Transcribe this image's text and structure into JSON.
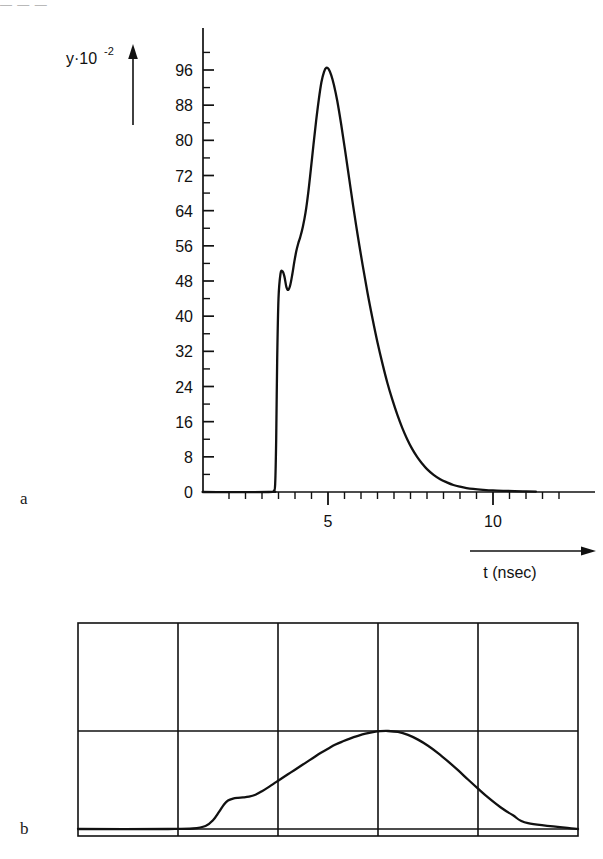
{
  "figure": {
    "top_artifact_text": "— — —",
    "panels": [
      {
        "letter": "a"
      },
      {
        "letter": "b"
      }
    ]
  },
  "panel_a": {
    "y_axis_title_main": "y·10",
    "y_axis_title_exponent": "-2",
    "x_axis_title": "t (nsec)",
    "y_tick_labels": [
      "0",
      "8",
      "16",
      "24",
      "32",
      "40",
      "48",
      "56",
      "64",
      "72",
      "80",
      "88",
      "96"
    ],
    "x_tick_labels": [
      "5",
      "10"
    ]
  },
  "chart_data": [
    {
      "type": "line",
      "name": "panel-a-pulse",
      "title": "",
      "xlabel": "t (nsec)",
      "ylabel": "y·10^-2",
      "xlim": [
        1.2,
        11.4
      ],
      "ylim": [
        0,
        101
      ],
      "grid": false,
      "legend": false,
      "y_ticks_major": [
        0,
        8,
        16,
        24,
        32,
        40,
        48,
        56,
        64,
        72,
        80,
        88,
        96
      ],
      "y_ticks_minor_step": 4,
      "x_ticks_major": [
        5,
        10
      ],
      "x_ticks_minor_step": 0.5,
      "x_tick_minor_range": [
        2.0,
        11.0
      ],
      "series_note": "Fast-rising scintillation/photomultiplier pulse with a prompt spike, small dip, main peak near t=5 ns, then slow exponential tail",
      "x": [
        1.2,
        3.2,
        3.36,
        3.4,
        3.43,
        3.46,
        3.5,
        3.56,
        3.62,
        3.68,
        3.74,
        3.8,
        3.86,
        3.92,
        3.98,
        4.04,
        4.1,
        4.16,
        4.24,
        4.32,
        4.4,
        4.48,
        4.56,
        4.64,
        4.72,
        4.8,
        4.88,
        4.95,
        5.02,
        5.1,
        5.18,
        5.28,
        5.4,
        5.52,
        5.64,
        5.76,
        5.9,
        6.05,
        6.2,
        6.35,
        6.5,
        6.65,
        6.8,
        6.95,
        7.1,
        7.25,
        7.4,
        7.55,
        7.7,
        7.85,
        8.0,
        8.2,
        8.4,
        8.6,
        8.8,
        9.0,
        9.2,
        9.4,
        9.7,
        10.0,
        10.4,
        10.9,
        11.3
      ],
      "y": [
        0.0,
        0.0,
        0.3,
        2.0,
        12.0,
        30.0,
        44.0,
        49.6,
        50.2,
        49.0,
        46.6,
        46.0,
        47.2,
        49.6,
        52.4,
        54.8,
        56.6,
        58.0,
        60.4,
        63.6,
        68.0,
        73.4,
        79.0,
        84.4,
        89.2,
        93.2,
        95.6,
        96.5,
        96.2,
        94.8,
        92.6,
        89.0,
        83.6,
        77.6,
        71.4,
        65.2,
        58.4,
        51.6,
        45.2,
        39.4,
        34.0,
        29.2,
        24.8,
        21.0,
        17.6,
        14.6,
        12.0,
        9.8,
        8.0,
        6.5,
        5.2,
        3.9,
        2.9,
        2.2,
        1.6,
        1.2,
        0.9,
        0.7,
        0.5,
        0.35,
        0.25,
        0.15,
        0.1
      ]
    },
    {
      "type": "line",
      "name": "panel-b-oscilloscope-trace",
      "title": "",
      "xlabel": "",
      "ylabel": "",
      "grid": true,
      "grid_columns": 5,
      "grid_rows": 2,
      "legend": false,
      "series_note": "Oscilloscope photograph of the same pulse: smoothed shoulder on the rising edge, peak touching the centre graticule line, long decaying tail",
      "xlim": [
        0,
        1
      ],
      "ylim": [
        0,
        1
      ],
      "x": [
        0.0,
        0.18,
        0.23,
        0.255,
        0.27,
        0.282,
        0.292,
        0.3,
        0.31,
        0.32,
        0.33,
        0.342,
        0.355,
        0.368,
        0.382,
        0.396,
        0.41,
        0.425,
        0.44,
        0.455,
        0.47,
        0.485,
        0.5,
        0.515,
        0.53,
        0.545,
        0.56,
        0.575,
        0.59,
        0.605,
        0.62,
        0.64,
        0.66,
        0.68,
        0.7,
        0.72,
        0.74,
        0.76,
        0.78,
        0.8,
        0.82,
        0.845,
        0.87,
        0.9,
        1.0
      ],
      "y": [
        0.0,
        0.0,
        0.005,
        0.03,
        0.09,
        0.175,
        0.25,
        0.29,
        0.31,
        0.318,
        0.322,
        0.33,
        0.35,
        0.385,
        0.43,
        0.478,
        0.525,
        0.575,
        0.625,
        0.675,
        0.725,
        0.775,
        0.82,
        0.862,
        0.895,
        0.925,
        0.95,
        0.972,
        0.988,
        0.998,
        1.0,
        0.99,
        0.96,
        0.912,
        0.85,
        0.775,
        0.69,
        0.6,
        0.505,
        0.412,
        0.322,
        0.222,
        0.14,
        0.06,
        0.0
      ]
    }
  ]
}
